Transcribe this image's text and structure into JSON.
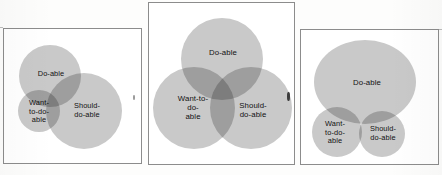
{
  "figure": {
    "type": "venn-diagram-series",
    "panel_count": 3,
    "set_labels": {
      "doable": "Do-able",
      "want": "Want-to-do-able",
      "should": "Should-do-able"
    },
    "colors": {
      "circle_fill": "#c9c9c9",
      "overlap_blend": "multiply",
      "panel_border": "#8c8c8c",
      "panel_background": "#ffffff",
      "label_text": "#111111",
      "page_background": "#fdfdfc"
    }
  },
  "panels": [
    {
      "id": "panel-left",
      "name": "left-panel",
      "labels": {
        "doable": "Do-able",
        "want": "Want-\nto-do-\nable",
        "should": "Should-\ndo-able"
      },
      "circles": [
        {
          "set": "doable",
          "cx": 46,
          "cy": 47,
          "r": 31
        },
        {
          "set": "want",
          "cx": 35,
          "cy": 82,
          "r": 21
        },
        {
          "set": "should",
          "cx": 80,
          "cy": 82,
          "r": 38
        }
      ]
    },
    {
      "id": "panel-middle",
      "name": "middle-panel",
      "labels": {
        "doable": "Do-able",
        "want": "Want-to-\ndo-\nable",
        "should": "Should-\ndo-able"
      },
      "circles": [
        {
          "set": "doable",
          "cx": 73,
          "cy": 56,
          "r": 41
        },
        {
          "set": "want",
          "cx": 45,
          "cy": 105,
          "r": 41
        },
        {
          "set": "should",
          "cx": 102,
          "cy": 105,
          "r": 41
        }
      ]
    },
    {
      "id": "panel-right",
      "name": "right-panel",
      "labels": {
        "doable": "Do-able",
        "want": "Want-\nto-do-\nable",
        "should": "Should-\ndo-able"
      },
      "circles": [
        {
          "set": "doable",
          "cx": 64,
          "cy": 52,
          "rx": 51,
          "ry": 42
        },
        {
          "set": "want",
          "cx": 36,
          "cy": 102,
          "r": 25
        },
        {
          "set": "should",
          "cx": 81,
          "cy": 104,
          "r": 23
        }
      ]
    }
  ]
}
